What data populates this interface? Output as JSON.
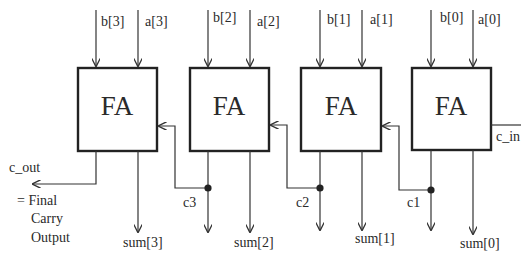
{
  "diagram": {
    "type": "4-bit ripple carry adder",
    "block_label": "FA",
    "blocks": [
      {
        "id": "fa3",
        "label": "FA",
        "input_b": "b[3]",
        "input_a": "a[3]",
        "sum": "sum[3]"
      },
      {
        "id": "fa2",
        "label": "FA",
        "input_b": "b[2]",
        "input_a": "a[2]",
        "sum": "sum[2]"
      },
      {
        "id": "fa1",
        "label": "FA",
        "input_b": "b[1]",
        "input_a": "a[1]",
        "sum": "sum[1]"
      },
      {
        "id": "fa0",
        "label": "FA",
        "input_b": "b[0]",
        "input_a": "a[0]",
        "sum": "sum[0]"
      }
    ],
    "carries": [
      "c3",
      "c2",
      "c1"
    ],
    "carry_in": "c_in",
    "carry_out": "c_out",
    "carry_out_note": [
      "= Final",
      "Carry",
      "Output"
    ],
    "colors": {
      "line": "#333333",
      "box_stroke": "#222222",
      "text": "#2a2a2a",
      "background": "#ffffff"
    }
  }
}
